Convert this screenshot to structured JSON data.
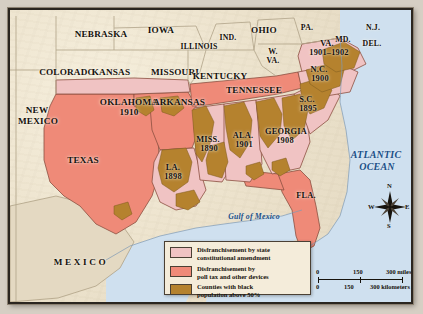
{
  "map": {
    "title": "Disfranchisement in the American South",
    "colors": {
      "constitutional_amendment": "#f0c3c3",
      "poll_tax": "#ef8a78",
      "black_majority_counties": "#b5822e",
      "non_south_land": "#ece2cc",
      "ocean": "#cfe0ef",
      "border": "#2b2620",
      "label_text": "#15110c",
      "ocean_text": "#1b4f86"
    },
    "states_non_south": [
      {
        "name": "COLORADO"
      },
      {
        "name": "NEBRASKA"
      },
      {
        "name": "IOWA"
      },
      {
        "name": "KANSAS"
      },
      {
        "name": "MISSOURI"
      },
      {
        "name": "ILLINOIS"
      },
      {
        "name": "IND."
      },
      {
        "name": "OHIO"
      },
      {
        "name": "PA."
      },
      {
        "name": "N.J."
      },
      {
        "name": "MD."
      },
      {
        "name": "DEL."
      },
      {
        "name": "W.\nVA."
      },
      {
        "name": "KENTUCKY"
      },
      {
        "name": "NEW\nMEXICO"
      }
    ],
    "states_south": [
      {
        "name": "OKLAHOMA",
        "year": "1910"
      },
      {
        "name": "ARKANSAS",
        "year": ""
      },
      {
        "name": "TENNESSEE",
        "year": ""
      },
      {
        "name": "TEXAS",
        "year": ""
      },
      {
        "name": "LA.",
        "year": "1898"
      },
      {
        "name": "MISS.",
        "year": "1890"
      },
      {
        "name": "ALA.",
        "year": "1901"
      },
      {
        "name": "GEORGIA",
        "year": "1908"
      },
      {
        "name": "S.C.",
        "year": "1895"
      },
      {
        "name": "N.C.",
        "year": "1900"
      },
      {
        "name": "VA.",
        "year": "1901–1902"
      },
      {
        "name": "FLA.",
        "year": ""
      }
    ],
    "water_labels": [
      {
        "name": "Gulf of Mexico"
      },
      {
        "name": "ATLANTIC\nOCEAN"
      }
    ],
    "country_labels": [
      {
        "name": "M E X I C O"
      }
    ]
  },
  "legend": {
    "items": [
      {
        "swatch": "#f0c3c3",
        "line1": "Disfranchisement by state",
        "line2": "constitutional amendment"
      },
      {
        "swatch": "#ef8a78",
        "line1": "Disfranchisement by",
        "line2": "poll tax and other devices"
      },
      {
        "swatch": "#b5822e",
        "line1": "Counties with black",
        "line2": "population above 50%"
      }
    ]
  },
  "scale": {
    "miles": {
      "t0": "0",
      "t1": "150",
      "t2": "300 miles"
    },
    "kilometers": {
      "t0": "0",
      "t1": "150",
      "t2": "300 kilometers"
    }
  },
  "compass": {
    "n": "N",
    "e": "E",
    "s": "S",
    "w": "W"
  },
  "text": {
    "colorado": "COLORADO",
    "nebraska": "NEBRASKA",
    "iowa": "IOWA",
    "kansas": "KANSAS",
    "missouri": "MISSOURI",
    "illinois": "ILLINOIS",
    "indiana": "IND.",
    "ohio": "OHIO",
    "pennsylvania": "PA.",
    "newjersey": "N.J.",
    "maryland": "MD.",
    "delaware": "DEL.",
    "wvirginia_1": "W.",
    "wvirginia_2": "VA.",
    "kentucky": "KENTUCKY",
    "newmexico_1": "NEW",
    "newmexico_2": "MEXICO",
    "oklahoma": "OKLAHOMA",
    "oklahoma_year": "1910",
    "arkansas": "ARKANSAS",
    "tennessee": "TENNESSEE",
    "texas": "TEXAS",
    "louisiana": "LA.",
    "louisiana_year": "1898",
    "mississippi": "MISS.",
    "mississippi_year": "1890",
    "alabama": "ALA.",
    "alabama_year": "1901",
    "georgia": "GEORGIA",
    "georgia_year": "1908",
    "scarolina": "S.C.",
    "scarolina_year": "1895",
    "ncarolina": "N.C.",
    "ncarolina_year": "1900",
    "virginia": "VA.",
    "virginia_year": "1901–1902",
    "florida": "FLA.",
    "gulf": "Gulf of Mexico",
    "atlantic_1": "ATLANTIC",
    "atlantic_2": "OCEAN",
    "mexico": "MEXICO"
  }
}
